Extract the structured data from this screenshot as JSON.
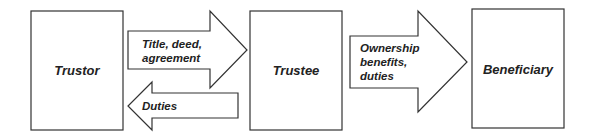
{
  "diagram": {
    "nodes": [
      {
        "id": "trustor",
        "label": "Trustor"
      },
      {
        "id": "trustee",
        "label": "Trustee"
      },
      {
        "id": "beneficiary",
        "label": "Beneficiary"
      }
    ],
    "arrows": [
      {
        "id": "trustor-to-trustee",
        "direction": "right",
        "label_lines": [
          "Title, deed,",
          "agreement"
        ]
      },
      {
        "id": "trustee-to-trustor",
        "direction": "left",
        "label_lines": [
          "Duties"
        ]
      },
      {
        "id": "trustee-to-beneficiary",
        "direction": "right",
        "label_lines": [
          "Ownership",
          "benefits,",
          "duties"
        ]
      }
    ],
    "colors": {
      "stroke": "#333333",
      "fill": "#ffffff",
      "text": "#222222"
    }
  }
}
